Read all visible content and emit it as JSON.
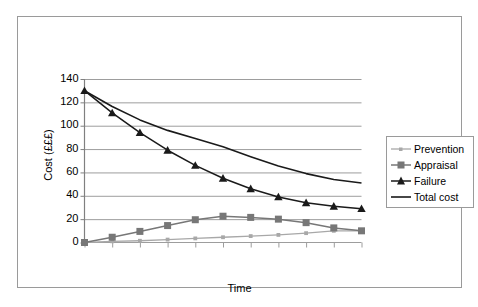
{
  "chart_data": {
    "type": "line",
    "title": "",
    "xlabel": "Time",
    "ylabel": "Cost (£££)",
    "x": [
      0,
      1,
      2,
      3,
      4,
      5,
      6,
      7,
      8,
      9,
      10
    ],
    "xtick_labels": [
      "",
      "",
      "",
      "",
      "",
      "",
      "",
      "",
      "",
      "",
      ""
    ],
    "ytick_labels": [
      "0",
      "20",
      "40",
      "60",
      "80",
      "100",
      "120",
      "140"
    ],
    "yticks": [
      0,
      20,
      40,
      60,
      80,
      100,
      120,
      140
    ],
    "ylim": [
      0,
      140
    ],
    "xlim": [
      0,
      10
    ],
    "grid": "horizontal",
    "legend_position": "right",
    "series": [
      {
        "name": "Prevention",
        "values": [
          0,
          1,
          1.5,
          2.5,
          3.5,
          4.5,
          5.5,
          6.5,
          8,
          10,
          10
        ],
        "color": "#a8a8a8",
        "marker": "small-dot"
      },
      {
        "name": "Appraisal",
        "values": [
          0,
          4.5,
          9.5,
          14.5,
          19.5,
          22.5,
          21.5,
          20,
          17,
          12.5,
          10
        ],
        "color": "#777777",
        "marker": "square"
      },
      {
        "name": "Failure",
        "values": [
          130,
          111,
          94,
          79,
          66,
          55,
          46,
          39,
          34,
          31,
          29
        ],
        "color": "#1a1a1a",
        "marker": "triangle"
      },
      {
        "name": "Total cost",
        "values": [
          130,
          116.5,
          105,
          96,
          89,
          82,
          73.5,
          65.5,
          59,
          54,
          51
        ],
        "color": "#1a1a1a",
        "marker": "none"
      }
    ]
  },
  "legend": {
    "items": [
      {
        "label": "Prevention"
      },
      {
        "label": "Appraisal"
      },
      {
        "label": "Failure"
      },
      {
        "label": "Total cost"
      }
    ]
  },
  "axes": {
    "y_title": "Cost (£££)",
    "x_title": "Time",
    "y_ticks": [
      "140",
      "120",
      "100",
      "80",
      "60",
      "40",
      "20",
      "0"
    ]
  },
  "colors": {
    "prevention": "#a8a8a8",
    "appraisal": "#777777",
    "failure": "#1a1a1a",
    "total": "#1a1a1a",
    "grid": "#9d9d9d",
    "axis": "#808080",
    "frame": "#9a9a9a",
    "background": "#ffffff"
  }
}
